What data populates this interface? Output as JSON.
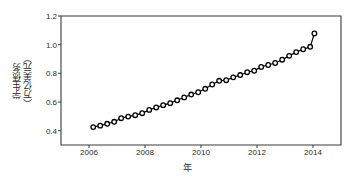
{
  "chart_data": {
    "type": "line",
    "title": "",
    "subtitle": "",
    "xlabel": "年",
    "ylabel": "学生债务（万亿美元）",
    "ylabel_lines": [
      "学生债务",
      "（万亿美元）"
    ],
    "xlim": [
      2005.0,
      2015.0
    ],
    "ylim": [
      0.3,
      1.2
    ],
    "xticks": [
      2006,
      2008,
      2010,
      2012,
      2014
    ],
    "xtick_labels": [
      "2006",
      "2008",
      "2010",
      "2012",
      "2014"
    ],
    "yticks": [
      0.4,
      0.6,
      0.8,
      1.0,
      1.2
    ],
    "ytick_labels": [
      "0.4",
      "0.6",
      "0.8",
      "1.0",
      "1.2"
    ],
    "grid": false,
    "legend": null,
    "marker": "open-circle",
    "marker_color": "#000000",
    "line_color": "#000000",
    "series": [
      {
        "name": "学生债务",
        "x": [
          2006.15,
          2006.4,
          2006.65,
          2006.9,
          2007.15,
          2007.4,
          2007.65,
          2007.9,
          2008.15,
          2008.4,
          2008.65,
          2008.9,
          2009.15,
          2009.4,
          2009.65,
          2009.9,
          2010.15,
          2010.4,
          2010.65,
          2010.9,
          2011.15,
          2011.4,
          2011.65,
          2011.9,
          2012.15,
          2012.4,
          2012.65,
          2012.9,
          2013.15,
          2013.4,
          2013.65,
          2013.9,
          2014.05
        ],
        "y": [
          0.425,
          0.435,
          0.448,
          0.462,
          0.487,
          0.498,
          0.508,
          0.522,
          0.545,
          0.562,
          0.578,
          0.592,
          0.612,
          0.632,
          0.652,
          0.668,
          0.692,
          0.722,
          0.748,
          0.752,
          0.772,
          0.788,
          0.808,
          0.818,
          0.845,
          0.858,
          0.872,
          0.895,
          0.922,
          0.948,
          0.968,
          0.985,
          1.078
        ]
      }
    ],
    "axes_color": "#3a3a3a",
    "background": "#ffffff"
  }
}
